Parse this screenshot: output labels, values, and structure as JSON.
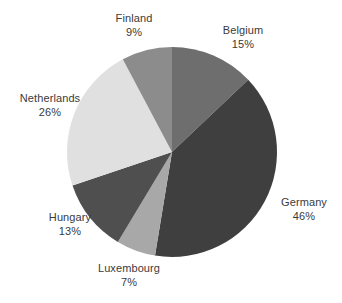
{
  "chart_data": {
    "type": "pie",
    "title": "",
    "subtitle": "",
    "xlabel": "",
    "ylabel": "",
    "legend_position": "none",
    "grid": false,
    "labels_on_slices": false,
    "label_format": "name + percent",
    "total_of_percentages": 116,
    "categories": [
      "Belgium",
      "Germany",
      "Luxembourg",
      "Hungary",
      "Netherlands",
      "Finland"
    ],
    "values": [
      15,
      46,
      7,
      13,
      26,
      9
    ],
    "slices": [
      {
        "name": "Belgium",
        "percent": 15,
        "percent_label": "15%",
        "color": "#6e6e6e"
      },
      {
        "name": "Germany",
        "percent": 46,
        "percent_label": "46%",
        "color": "#3f3f3f"
      },
      {
        "name": "Luxembourg",
        "percent": 7,
        "percent_label": "7%",
        "color": "#a8a8a8"
      },
      {
        "name": "Hungary",
        "percent": 13,
        "percent_label": "13%",
        "color": "#4f4f4f"
      },
      {
        "name": "Netherlands",
        "percent": 26,
        "percent_label": "26%",
        "color": "#e0e0e0"
      },
      {
        "name": "Finland",
        "percent": 9,
        "percent_label": "9%",
        "color": "#8c8c8c"
      }
    ],
    "geometry": {
      "center_x": 172,
      "center_y": 152,
      "radius": 105,
      "start_angle_deg": 0,
      "direction": "clockwise"
    }
  },
  "labels": {
    "belgium": {
      "name": "Belgium",
      "value": "15%"
    },
    "germany": {
      "name": "Germany",
      "value": "46%"
    },
    "luxembourg": {
      "name": "Luxembourg",
      "value": "7%"
    },
    "hungary": {
      "name": "Hungary",
      "value": "13%"
    },
    "netherlands": {
      "name": "Netherlands",
      "value": "26%"
    },
    "finland": {
      "name": "Finland",
      "value": "9%"
    }
  },
  "colors": {
    "background": "#ffffff",
    "text": "#3a3a3a",
    "belgium": "#6e6e6e",
    "germany": "#3f3f3f",
    "luxembourg": "#a8a8a8",
    "hungary": "#4f4f4f",
    "netherlands": "#e0e0e0",
    "finland": "#8c8c8c"
  }
}
